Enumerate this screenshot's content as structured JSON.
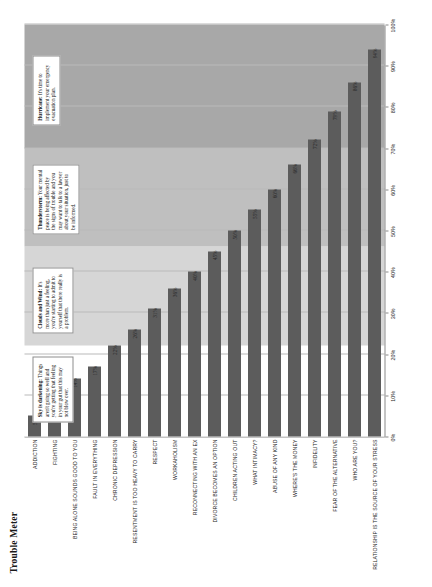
{
  "chart_data": {
    "type": "bar",
    "title": "Trouble Meter",
    "xlabel": "",
    "ylabel": "",
    "orientation": "horizontal",
    "xlim": [
      0,
      100
    ],
    "grid": true,
    "legend": "none",
    "tick_labels": [
      "0%",
      "10%",
      "20%",
      "30%",
      "40%",
      "50%",
      "60%",
      "70%",
      "80%",
      "90%",
      "100%"
    ],
    "tick_values": [
      0,
      10,
      20,
      30,
      40,
      50,
      60,
      70,
      80,
      90,
      100
    ],
    "categories": [
      "ADDICTION",
      "FIGHTING",
      "BEING ALONE SOUNDS GOOD TO YOU",
      "FAULT IN EVERYTHING",
      "CHRONIC DEPRESSION",
      "RESENTMENT IS TOO HEAVY TO CARRY",
      "RESPECT",
      "WORKAHOLISM",
      "RECONNECTING WITH AN EX",
      "DIVORCE BECOMES AN OPTION",
      "CHILDREN ACTING OUT",
      "WHAT INTIMACY?",
      "ABUSE OF ANY KIND",
      "WHERE'S THE MONEY",
      "INFIDELITY",
      "FEAR OF THE ALTERNATIVE",
      "WHO ARE YOU?",
      "RELATIONSHIP IS THE SOURCE OF YOUR STRESS"
    ],
    "values": [
      5,
      9,
      14,
      17,
      22,
      26,
      31,
      36,
      40,
      45,
      50,
      55,
      60,
      66,
      72,
      79,
      86,
      94
    ],
    "value_labels": [
      "5%",
      "9%",
      "14%",
      "17%",
      "22%",
      "26%",
      "31%",
      "36%",
      "40%",
      "45%",
      "50%",
      "55%",
      "60%",
      "66%",
      "72%",
      "79%",
      "86%",
      "94%"
    ],
    "bar_color": "#5c5c5c",
    "bands": [
      {
        "from": 0,
        "to": 22,
        "color": "#ffffff"
      },
      {
        "from": 22,
        "to": 46,
        "color": "#d6d6d6"
      },
      {
        "from": 46,
        "to": 70,
        "color": "#bfbfbf"
      },
      {
        "from": 70,
        "to": 100,
        "color": "#a8a8a8"
      }
    ]
  },
  "callouts": [
    {
      "id": "sky-is-darkening",
      "title": "Sky is darkening:",
      "body": " Things aren't going so well and you're getting that feeling in your gut that this may not blow over."
    },
    {
      "id": "clouds-and-wind",
      "title": "Clouds and Wind:",
      "body": " It's more than just a feeling, you're starting to admit to yourself that there really is a problem."
    },
    {
      "id": "thunderstorm",
      "title": "Thunderstorm:",
      "body": " Your mental peace is being affected by the signs of trouble and you may want to talk to a lawyer about your situation, just to be informed."
    },
    {
      "id": "hurricane",
      "title": "Hurricane:",
      "body": " It's time to implement your emergency evacuation plan."
    }
  ]
}
